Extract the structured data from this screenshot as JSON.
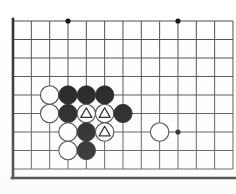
{
  "diagram": {
    "kind": "go-board-diagram",
    "board": {
      "columns": 13,
      "rows": 9,
      "origin_x": 13,
      "origin_y": 21,
      "step_x": 18.33,
      "step_y": 18.5,
      "line_color": "#4a4a4a",
      "edge_color": "#2b2b2b",
      "edge_width": 2.6,
      "line_width": 1.0,
      "background": "#ffffff",
      "left_edge_is_board_border": true,
      "bottom_edge_is_board_border": true,
      "top_edge_is_board_border": false,
      "right_edge_is_board_border": false
    },
    "star_points": [
      {
        "col": 3,
        "row": 0
      },
      {
        "col": 9,
        "row": 0
      },
      {
        "col": 9,
        "row": 6
      }
    ],
    "star_point_color": "#111111",
    "star_point_radius": 2.6,
    "stone_radius": 9.2,
    "black_stone_color": "#111111",
    "white_stone_color": "#ffffff",
    "white_stone_outline": "#3a3a3a",
    "marker_color": "#111111",
    "stones": [
      {
        "col": 2,
        "row": 4,
        "color": "white",
        "marker": "none"
      },
      {
        "col": 3,
        "row": 4,
        "color": "black",
        "marker": "none"
      },
      {
        "col": 4,
        "row": 4,
        "color": "black",
        "marker": "none"
      },
      {
        "col": 5,
        "row": 4,
        "color": "black",
        "marker": "none"
      },
      {
        "col": 2,
        "row": 5,
        "color": "white",
        "marker": "none"
      },
      {
        "col": 3,
        "row": 5,
        "color": "black",
        "marker": "none"
      },
      {
        "col": 4,
        "row": 5,
        "color": "white",
        "marker": "triangle"
      },
      {
        "col": 5,
        "row": 5,
        "color": "white",
        "marker": "triangle"
      },
      {
        "col": 6,
        "row": 5,
        "color": "black",
        "marker": "none"
      },
      {
        "col": 3,
        "row": 6,
        "color": "white",
        "marker": "none"
      },
      {
        "col": 4,
        "row": 6,
        "color": "black",
        "marker": "none"
      },
      {
        "col": 5,
        "row": 6,
        "color": "white",
        "marker": "triangle"
      },
      {
        "col": 8,
        "row": 6,
        "color": "white",
        "marker": "none"
      },
      {
        "col": 3,
        "row": 7,
        "color": "white",
        "marker": "none"
      },
      {
        "col": 4,
        "row": 7,
        "color": "black",
        "marker": "none"
      }
    ],
    "counts": {
      "black_stones": 7,
      "white_stones": 8,
      "triangle_marked_stones": 3
    }
  }
}
